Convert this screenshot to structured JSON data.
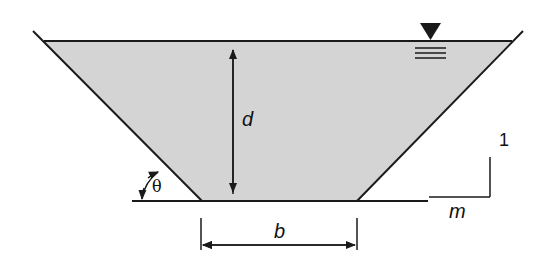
{
  "diagram": {
    "labels": {
      "depth": "d",
      "bottom_width": "b",
      "angle": "θ",
      "slope_vertical": "1",
      "slope_horizontal": "m"
    },
    "symbols": {
      "water_surface": "water-surface-triangle"
    },
    "colors": {
      "water_fill": "#d4d4d4",
      "line": "#1a1a1a",
      "background": "#ffffff"
    }
  }
}
